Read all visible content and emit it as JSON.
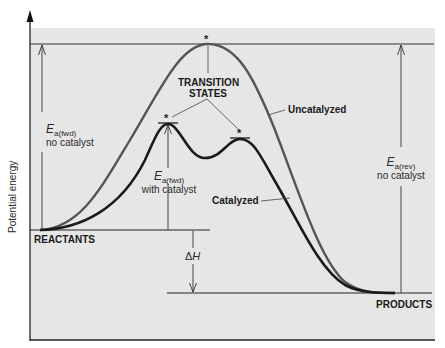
{
  "diagram": {
    "y_axis_label": "Potential energy",
    "levels": {
      "reactants": "REACTANTS",
      "products": "PRODUCTS"
    },
    "curves": {
      "uncatalyzed": "Uncatalyzed",
      "catalyzed": "Catalyzed"
    },
    "transition_states": {
      "line1": "TRANSITION",
      "line2": "STATES",
      "marker": "*"
    },
    "annotations": {
      "ea_fwd_no_catalyst": {
        "symbol": "E",
        "subscript": "a(fwd)",
        "caption": "no catalyst"
      },
      "ea_fwd_with_catalyst": {
        "symbol": "E",
        "subscript": "a(fwd)",
        "caption": "with catalyst"
      },
      "ea_rev_no_catalyst": {
        "symbol": "E",
        "subscript": "a(rev)",
        "caption": "no catalyst"
      },
      "delta_h": {
        "symbol": "Δ",
        "italic": "H"
      }
    },
    "colors": {
      "plot_background": "#e6e6e6",
      "uncatalyzed_curve": "#555555",
      "catalyzed_curve": "#1a1a1a",
      "axis": "#222222"
    }
  }
}
